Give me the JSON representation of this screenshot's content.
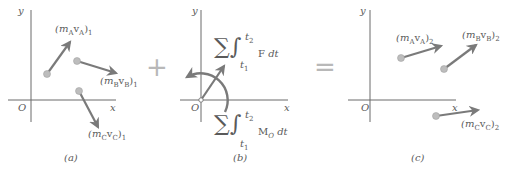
{
  "diagram": {
    "colors": {
      "axis": "#6b6b6b",
      "arrow": "#7a7a7a",
      "point": "#bdbdbd",
      "text": "#5a5a5a",
      "operator": "#b8b8b8"
    },
    "operators": {
      "plus": "+",
      "equals": "="
    },
    "panel_a": {
      "caption": "(a)",
      "axis_y": "y",
      "axis_x": "x",
      "origin": "O",
      "labels": {
        "A": {
          "open": "(m",
          "sub1": "A",
          "mid": "v",
          "sub2": "A",
          "close": ")",
          "idx": "1"
        },
        "B": {
          "open": "(m",
          "sub1": "B",
          "mid": "v",
          "sub2": "B",
          "close": ")",
          "idx": "1"
        },
        "C": {
          "open": "(m",
          "sub1": "C",
          "mid": "v",
          "sub2": "C",
          "close": ")",
          "idx": "1"
        }
      }
    },
    "panel_b": {
      "caption": "(b)",
      "axis_y": "y",
      "axis_x": "x",
      "origin": "O",
      "force_impulse": {
        "sigma": "∑",
        "integral": "∫",
        "upper": "t",
        "upper_sub": "2",
        "lower": "t",
        "lower_sub": "1",
        "integrand": "F",
        "dt": "dt"
      },
      "moment_impulse": {
        "sigma": "∑",
        "integral": "∫",
        "upper": "t",
        "upper_sub": "2",
        "lower": "t",
        "lower_sub": "1",
        "integrand": "M",
        "integrand_sub": "O",
        "dt": "dt"
      }
    },
    "panel_c": {
      "caption": "(c)",
      "axis_y": "y",
      "axis_x": "x",
      "origin": "O",
      "labels": {
        "A": {
          "open": "(m",
          "sub1": "A",
          "mid": "v",
          "sub2": "A",
          "close": ")",
          "idx": "2"
        },
        "B": {
          "open": "(m",
          "sub1": "B",
          "mid": "v",
          "sub2": "B",
          "close": ")",
          "idx": "2"
        },
        "C": {
          "open": "(m",
          "sub1": "C",
          "mid": "v",
          "sub2": "C",
          "close": ")",
          "idx": "2"
        }
      }
    }
  }
}
